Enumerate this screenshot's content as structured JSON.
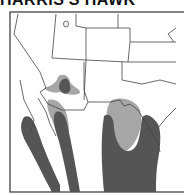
{
  "title": "HARRIS'S HAWK",
  "map": {
    "subject": "range-map",
    "colors": {
      "background": "#ffffff",
      "border": "#333333",
      "state_line": "#444444",
      "range_dark": "#555555",
      "range_light": "#a6a6a6"
    },
    "legend": []
  }
}
